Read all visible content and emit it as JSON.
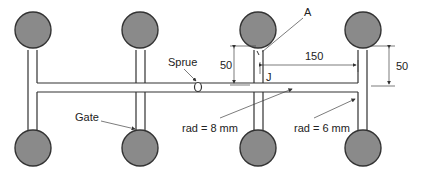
{
  "diagram": {
    "title": "",
    "type": "injection mold runner layout",
    "labels": {
      "sprue": "Sprue",
      "gate": "Gate",
      "point_a": "A",
      "point_j": "J",
      "rad_primary": "rad = 8 mm",
      "rad_secondary": "rad = 6 mm",
      "dim_vertical_left": "50",
      "dim_horizontal": "150",
      "dim_vertical_right": "50"
    },
    "components": {
      "cavities": 8,
      "cavity_color": "#8a8a8a",
      "line_color": "#333333"
    }
  }
}
